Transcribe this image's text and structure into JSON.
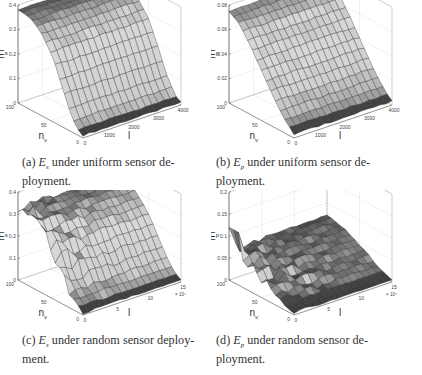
{
  "figure": {
    "panels": [
      {
        "id": "a",
        "caption_label": "(a)",
        "caption_var": "E",
        "caption_sub": "s",
        "caption_rest_line1": "under uniform sensor de-",
        "caption_rest_line2": "ployment.",
        "zlabel": "E",
        "zlabel_sub": "s",
        "xlabel": "l",
        "ylabel": "n",
        "ylabel_sub": "v"
      },
      {
        "id": "b",
        "caption_label": "(b)",
        "caption_var": "E",
        "caption_sub": "p",
        "caption_rest_line1": "under uniform sensor de-",
        "caption_rest_line2": "ployment.",
        "zlabel": "E",
        "zlabel_sub": "p",
        "xlabel": "l",
        "ylabel": "n",
        "ylabel_sub": "v"
      },
      {
        "id": "c",
        "caption_label": "(c)",
        "caption_var": "E",
        "caption_sub": "s",
        "caption_rest_line1": "under random sensor deploy-",
        "caption_rest_line2": "ment.",
        "zlabel": "E",
        "zlabel_sub": "s",
        "xlabel": "l",
        "ylabel": "n",
        "ylabel_sub": "v",
        "x_multiplier": "× 10⁴"
      },
      {
        "id": "d",
        "caption_label": "(d)",
        "caption_var": "E",
        "caption_sub": "p",
        "caption_rest_line1": "under random sensor de-",
        "caption_rest_line2": "ployment.",
        "zlabel": "E",
        "zlabel_sub": "p",
        "xlabel": "l",
        "ylabel": "n",
        "ylabel_sub": "v",
        "x_multiplier": "× 10⁴"
      }
    ]
  },
  "chart_data": [
    {
      "type": "surface3d",
      "title": "(a) E_s under uniform sensor deployment",
      "xlabel": "l",
      "ylabel": "n_v",
      "zlabel": "E_s",
      "x_ticks": [
        0,
        1000,
        2000,
        3000,
        4000
      ],
      "y_ticks": [
        0,
        50,
        100
      ],
      "z_ticks": [
        0,
        0.1,
        0.2,
        0.3,
        0.4
      ],
      "xlim": [
        0,
        4000
      ],
      "ylim": [
        0,
        100
      ],
      "zlim": [
        0,
        0.4
      ],
      "description": "Surface near 0.38 at high n_v, decreasing smoothly (sigmoid-like) to ~0.01 at n_v=0; nearly constant along l",
      "profile_vs_nv": {
        "n_v": [
          0,
          10,
          20,
          30,
          40,
          50,
          60,
          70,
          80,
          90,
          100
        ],
        "E": [
          0.01,
          0.03,
          0.08,
          0.15,
          0.22,
          0.28,
          0.32,
          0.35,
          0.37,
          0.38,
          0.38
        ]
      }
    },
    {
      "type": "surface3d",
      "title": "(b) E_p under uniform sensor deployment",
      "xlabel": "l",
      "ylabel": "n_v",
      "zlabel": "E_p",
      "x_ticks": [
        0,
        1000,
        2000,
        3000,
        4000
      ],
      "y_ticks": [
        0,
        50,
        100
      ],
      "z_ticks": [
        0,
        0.02,
        0.04,
        0.06,
        0.08
      ],
      "xlim": [
        0,
        4000
      ],
      "ylim": [
        0,
        100
      ],
      "zlim": [
        0,
        0.08
      ],
      "description": "Surface near 0.075 at high n_v decreasing roughly linearly to ~0.003 at n_v=0",
      "profile_vs_nv": {
        "n_v": [
          0,
          10,
          20,
          30,
          40,
          50,
          60,
          70,
          80,
          90,
          100
        ],
        "E": [
          0.003,
          0.008,
          0.015,
          0.023,
          0.032,
          0.041,
          0.05,
          0.058,
          0.066,
          0.072,
          0.075
        ]
      }
    },
    {
      "type": "surface3d",
      "title": "(c) E_s under random sensor deployment",
      "xlabel": "l",
      "ylabel": "n_v",
      "zlabel": "E_s",
      "x_ticks": [
        0,
        5,
        10,
        15
      ],
      "x_multiplier": "x 10^4",
      "y_ticks": [
        0,
        50,
        100
      ],
      "z_ticks": [
        0,
        0.1,
        0.2,
        0.3,
        0.4
      ],
      "xlim": [
        0,
        15
      ],
      "ylim": [
        0,
        100
      ],
      "zlim": [
        0,
        0.4
      ],
      "description": "Noisy near l=0, surface ~0.33 at high n_v decreasing to ~0.01 at n_v=0",
      "profile_vs_nv": {
        "n_v": [
          0,
          10,
          20,
          30,
          40,
          50,
          60,
          70,
          80,
          90,
          100
        ],
        "E": [
          0.01,
          0.03,
          0.07,
          0.12,
          0.18,
          0.23,
          0.27,
          0.3,
          0.32,
          0.33,
          0.33
        ]
      }
    },
    {
      "type": "surface3d",
      "title": "(d) E_p under random sensor deployment",
      "xlabel": "l",
      "ylabel": "n_v",
      "zlabel": "E_p",
      "x_ticks": [
        0,
        5,
        10,
        15
      ],
      "x_multiplier": "x 10^4",
      "y_ticks": [
        0,
        50,
        100
      ],
      "z_ticks": [
        0,
        0.05,
        0.1,
        0.15,
        0.2
      ],
      "xlim": [
        0,
        15
      ],
      "ylim": [
        0,
        100
      ],
      "zlim": [
        0,
        0.2
      ],
      "description": "Spike ~0.12 near l=0 at high n_v, otherwise ~0.07 at high n_v decreasing to ~0.005 at n_v=0",
      "profile_vs_nv": {
        "n_v": [
          0,
          10,
          20,
          30,
          40,
          50,
          60,
          70,
          80,
          90,
          100
        ],
        "E": [
          0.005,
          0.01,
          0.018,
          0.027,
          0.036,
          0.045,
          0.053,
          0.06,
          0.066,
          0.07,
          0.072
        ]
      }
    }
  ]
}
